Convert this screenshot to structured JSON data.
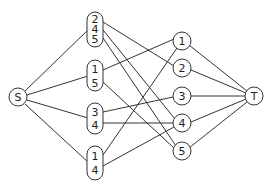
{
  "diagram": {
    "source": {
      "id": "S",
      "label": "S"
    },
    "sink": {
      "id": "T",
      "label": "T"
    },
    "left_nodes": [
      {
        "id": "L1",
        "labels": [
          "2",
          "4",
          "5"
        ]
      },
      {
        "id": "L2",
        "labels": [
          "1",
          "5"
        ]
      },
      {
        "id": "L3",
        "labels": [
          "3",
          "4"
        ]
      },
      {
        "id": "L4",
        "labels": [
          "1",
          "4"
        ]
      }
    ],
    "right_nodes": [
      {
        "id": "1",
        "label": "1"
      },
      {
        "id": "2",
        "label": "2"
      },
      {
        "id": "3",
        "label": "3"
      },
      {
        "id": "4",
        "label": "4"
      },
      {
        "id": "5",
        "label": "5"
      }
    ],
    "edges": [
      [
        "S",
        "L1"
      ],
      [
        "S",
        "L2"
      ],
      [
        "S",
        "L3"
      ],
      [
        "S",
        "L4"
      ],
      [
        "L1",
        "2"
      ],
      [
        "L1",
        "4"
      ],
      [
        "L1",
        "5"
      ],
      [
        "L2",
        "1"
      ],
      [
        "L2",
        "5"
      ],
      [
        "L3",
        "3"
      ],
      [
        "L3",
        "4"
      ],
      [
        "L4",
        "1"
      ],
      [
        "L4",
        "4"
      ],
      [
        "1",
        "T"
      ],
      [
        "2",
        "T"
      ],
      [
        "3",
        "T"
      ],
      [
        "4",
        "T"
      ],
      [
        "5",
        "T"
      ]
    ]
  }
}
